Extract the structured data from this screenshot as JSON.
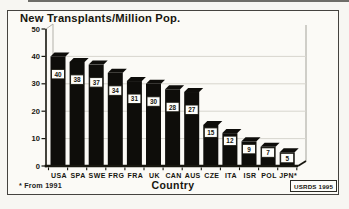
{
  "chart_data": {
    "type": "bar",
    "title": "New Transplants/Million Pop.",
    "xlabel": "Country",
    "ylabel": "",
    "ylim": [
      0,
      50
    ],
    "yticks": [
      0,
      10,
      20,
      30,
      40,
      50
    ],
    "categories": [
      "USA",
      "SPA",
      "SWE",
      "FRG",
      "FRA",
      "UK",
      "CAN",
      "AUS",
      "CZE",
      "ITA",
      "ISR",
      "POL",
      "JPN*"
    ],
    "values": [
      40,
      38,
      37,
      34,
      31,
      30,
      28,
      27,
      15,
      12,
      9,
      7,
      5
    ],
    "bar_value_labels": true,
    "grid": true,
    "legend": "none",
    "style": "3d-black-bars",
    "footnote": "* From 1991",
    "source": "USRDS 1995"
  },
  "colors": {
    "ink": "#17160f",
    "bar": "#0e0d0a",
    "grid": "#d7d5ce",
    "wall": "#b3b1aa",
    "paper": "#fbfaf6",
    "value_box_bg": "#fefefb"
  }
}
